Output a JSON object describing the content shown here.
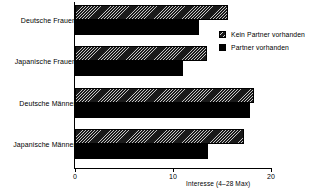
{
  "chart_data": {
    "type": "bar",
    "orientation": "horizontal",
    "title": "",
    "xlabel": "Interesse (4–28 Max)",
    "ylabel": "",
    "xlim": [
      0,
      20
    ],
    "xticks": [
      0,
      10,
      20
    ],
    "xtick_labels": [
      "0",
      "10",
      "20"
    ],
    "grid": false,
    "legend_position": "upper right",
    "categories": [
      "Deutsche Frauen",
      "Japanische Frauen",
      "Deutsche Männer",
      "Japanische Männer"
    ],
    "series": [
      {
        "name": "Kein Partner vorhanden",
        "fill": "hatched",
        "values": [
          15.6,
          13.5,
          18.3,
          17.2
        ]
      },
      {
        "name": "Partner vorhanden",
        "fill": "solid",
        "values": [
          12.7,
          11.0,
          17.9,
          13.6
        ]
      }
    ]
  },
  "legend": {
    "items": [
      {
        "label": "Kein Partner vorhanden",
        "swatch": "hatched"
      },
      {
        "label": "Partner vorhanden",
        "swatch": "solid"
      }
    ]
  },
  "axis": {
    "x_title": "Interesse (4–28 Max)",
    "tick_0": "0",
    "tick_10": "10",
    "tick_20": "20"
  },
  "categories": {
    "c0": "Deutsche Frauen",
    "c1": "Japanische Frauen",
    "c2": "Deutsche Männer",
    "c3": "Japanische Männer"
  },
  "colors": {
    "ink": "#000000",
    "background": "#ffffff"
  }
}
